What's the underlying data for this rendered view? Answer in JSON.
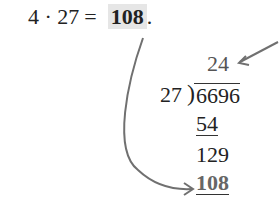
{
  "equation": {
    "left": "4 · 27",
    "equals": "=",
    "result": "108",
    "period": "."
  },
  "long_division": {
    "quotient": "24",
    "divisor": "27",
    "dividend": "6696",
    "steps": [
      "54",
      "129",
      "108"
    ]
  },
  "colors": {
    "highlight": "#e6e6e6",
    "arrow": "#707070"
  }
}
